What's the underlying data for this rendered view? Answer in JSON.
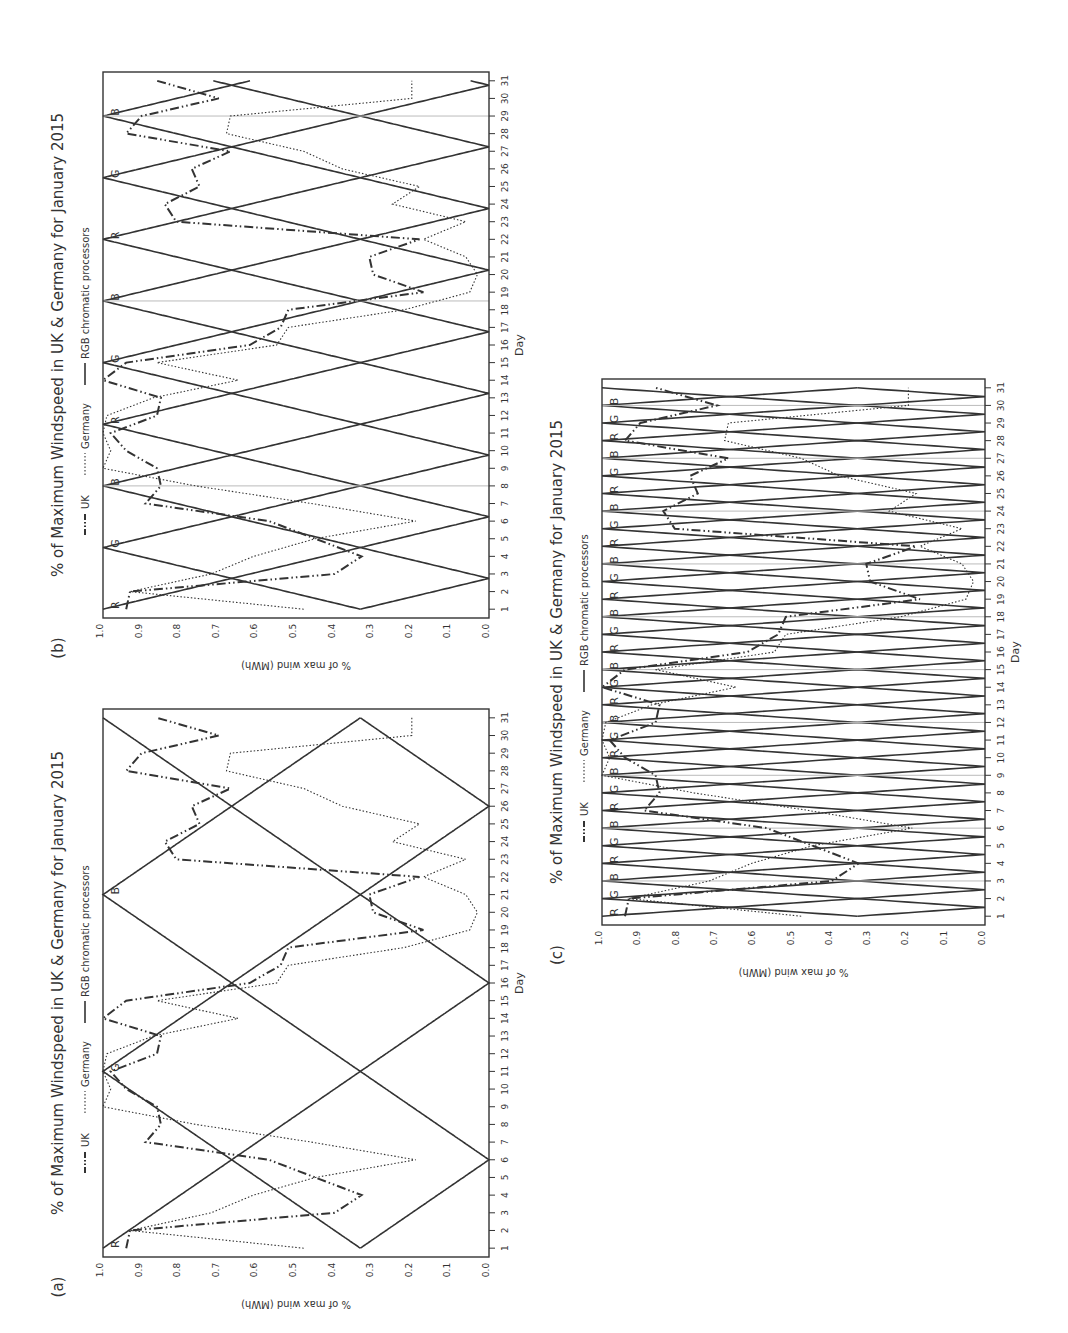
{
  "figure": {
    "title": "% of Maximum Windspeed in UK & Germany for January 2015",
    "legend": {
      "uk": "UK",
      "germany": "Germany",
      "rgb": "RGB chromatic processors"
    },
    "xlabel": "Day",
    "ylabel": "% of max wind (MWh)",
    "x_ticks": [
      "1",
      "2",
      "3",
      "4",
      "5",
      "6",
      "7",
      "8",
      "9",
      "10",
      "11",
      "12",
      "13",
      "14",
      "15",
      "16",
      "17",
      "18",
      "19",
      "20",
      "21",
      "22",
      "23",
      "24",
      "25",
      "26",
      "27",
      "28",
      "29",
      "30",
      "31"
    ],
    "y_ticks": [
      "0.0",
      "0.1",
      "0.2",
      "0.3",
      "0.4",
      "0.5",
      "0.6",
      "0.7",
      "0.8",
      "0.9",
      "1.0"
    ],
    "colors": {
      "ink": "#333333",
      "grid": "#bbbbbb",
      "background": "#ffffff"
    }
  },
  "panels": [
    {
      "id": "a",
      "label": "(a)",
      "rgb_period_days": 10,
      "marker_labels": [
        "R",
        "G",
        "B"
      ]
    },
    {
      "id": "b",
      "label": "(b)",
      "rgb_period_days": 3.5,
      "marker_labels": [
        "R",
        "G",
        "B",
        "R",
        "G",
        "B",
        "R",
        "G",
        "B",
        "R"
      ]
    },
    {
      "id": "c",
      "label": "(c)",
      "rgb_period_days": 1,
      "marker_labels": [
        "R",
        "G",
        "B",
        "R",
        "G",
        "B",
        "R",
        "G",
        "B",
        "R",
        "G",
        "B",
        "R",
        "G",
        "B",
        "R",
        "G",
        "B",
        "R",
        "G",
        "B",
        "R",
        "G",
        "B",
        "R",
        "G",
        "B",
        "R",
        "G",
        "B"
      ]
    }
  ],
  "chart_data": [
    {
      "panel": "a",
      "type": "line",
      "title": "% of Maximum Windspeed in UK & Germany for January 2015",
      "xlabel": "Day",
      "ylabel": "% of max wind (MWh)",
      "xlim": [
        1,
        31
      ],
      "ylim": [
        0.0,
        1.0
      ],
      "x": [
        1,
        2,
        3,
        4,
        5,
        6,
        7,
        8,
        9,
        10,
        11,
        12,
        13,
        14,
        15,
        16,
        17,
        18,
        19,
        20,
        21,
        22,
        23,
        24,
        25,
        26,
        27,
        28,
        29,
        30,
        31
      ],
      "series": [
        {
          "name": "UK",
          "style": "dash-dot-dot",
          "values": [
            0.94,
            0.93,
            0.4,
            0.33,
            0.45,
            0.57,
            0.89,
            0.85,
            0.86,
            0.94,
            0.98,
            0.86,
            0.85,
            1.0,
            0.94,
            0.62,
            0.54,
            0.52,
            0.17,
            0.3,
            0.31,
            0.18,
            0.81,
            0.84,
            0.75,
            0.77,
            0.67,
            0.94,
            0.9,
            0.7,
            0.86
          ]
        },
        {
          "name": "Germany",
          "style": "dotted",
          "values": [
            0.48,
            0.93,
            0.72,
            0.61,
            0.45,
            0.19,
            0.46,
            0.76,
            1.0,
            0.98,
            1.0,
            0.99,
            0.87,
            0.65,
            0.86,
            0.55,
            0.52,
            0.22,
            0.05,
            0.03,
            0.06,
            0.17,
            0.06,
            0.25,
            0.18,
            0.38,
            0.48,
            0.68,
            0.67,
            0.2,
            0.2
          ]
        },
        {
          "name": "RGB chromatic processors",
          "style": "solid",
          "period_days": 10,
          "peak_days": {
            "R": 1,
            "G": 16,
            "B": 31
          }
        }
      ],
      "annotations": [
        "R",
        "G",
        "B"
      ]
    },
    {
      "panel": "b",
      "type": "line",
      "title": "% of Maximum Windspeed in UK & Germany for January 2015",
      "xlabel": "Day",
      "ylabel": "% of max wind (MWh)",
      "xlim": [
        1,
        31
      ],
      "ylim": [
        0.0,
        1.0
      ],
      "x": [
        1,
        2,
        3,
        4,
        5,
        6,
        7,
        8,
        9,
        10,
        11,
        12,
        13,
        14,
        15,
        16,
        17,
        18,
        19,
        20,
        21,
        22,
        23,
        24,
        25,
        26,
        27,
        28,
        29,
        30,
        31
      ],
      "series": [
        {
          "name": "UK",
          "style": "dash-dot-dot",
          "values": [
            0.94,
            0.93,
            0.4,
            0.33,
            0.45,
            0.57,
            0.89,
            0.85,
            0.86,
            0.94,
            0.98,
            0.86,
            0.85,
            1.0,
            0.94,
            0.62,
            0.54,
            0.52,
            0.17,
            0.3,
            0.31,
            0.18,
            0.81,
            0.84,
            0.75,
            0.77,
            0.67,
            0.94,
            0.9,
            0.7,
            0.86
          ]
        },
        {
          "name": "Germany",
          "style": "dotted",
          "values": [
            0.48,
            0.93,
            0.72,
            0.61,
            0.45,
            0.19,
            0.46,
            0.76,
            1.0,
            0.98,
            1.0,
            0.99,
            0.87,
            0.65,
            0.86,
            0.55,
            0.52,
            0.22,
            0.05,
            0.03,
            0.06,
            0.17,
            0.06,
            0.25,
            0.18,
            0.38,
            0.48,
            0.68,
            0.67,
            0.2,
            0.2
          ]
        },
        {
          "name": "RGB chromatic processors",
          "style": "solid",
          "period_days": 3.5
        }
      ],
      "annotations": [
        "R",
        "G",
        "B",
        "R",
        "G",
        "B",
        "R",
        "G",
        "B",
        "R"
      ]
    },
    {
      "panel": "c",
      "type": "line",
      "title": "% of Maximum Windspeed in UK & Germany for January 2015",
      "xlabel": "Day",
      "ylabel": "% of max wind (MWh)",
      "xlim": [
        1,
        31
      ],
      "ylim": [
        0.0,
        1.0
      ],
      "x": [
        1,
        2,
        3,
        4,
        5,
        6,
        7,
        8,
        9,
        10,
        11,
        12,
        13,
        14,
        15,
        16,
        17,
        18,
        19,
        20,
        21,
        22,
        23,
        24,
        25,
        26,
        27,
        28,
        29,
        30,
        31
      ],
      "series": [
        {
          "name": "UK",
          "style": "dash-dot-dot",
          "values": [
            0.94,
            0.93,
            0.4,
            0.33,
            0.45,
            0.57,
            0.89,
            0.85,
            0.86,
            0.94,
            0.98,
            0.86,
            0.85,
            1.0,
            0.94,
            0.62,
            0.54,
            0.52,
            0.17,
            0.3,
            0.31,
            0.18,
            0.81,
            0.84,
            0.75,
            0.77,
            0.67,
            0.94,
            0.9,
            0.7,
            0.86
          ]
        },
        {
          "name": "Germany",
          "style": "dotted",
          "values": [
            0.48,
            0.93,
            0.72,
            0.61,
            0.45,
            0.19,
            0.46,
            0.76,
            1.0,
            0.98,
            1.0,
            0.99,
            0.87,
            0.65,
            0.86,
            0.55,
            0.52,
            0.22,
            0.05,
            0.03,
            0.06,
            0.17,
            0.06,
            0.25,
            0.18,
            0.38,
            0.48,
            0.68,
            0.67,
            0.2,
            0.2
          ]
        },
        {
          "name": "RGB chromatic processors",
          "style": "solid",
          "period_days": 1
        }
      ],
      "annotations": [
        "R",
        "G",
        "B",
        "..."
      ]
    }
  ]
}
